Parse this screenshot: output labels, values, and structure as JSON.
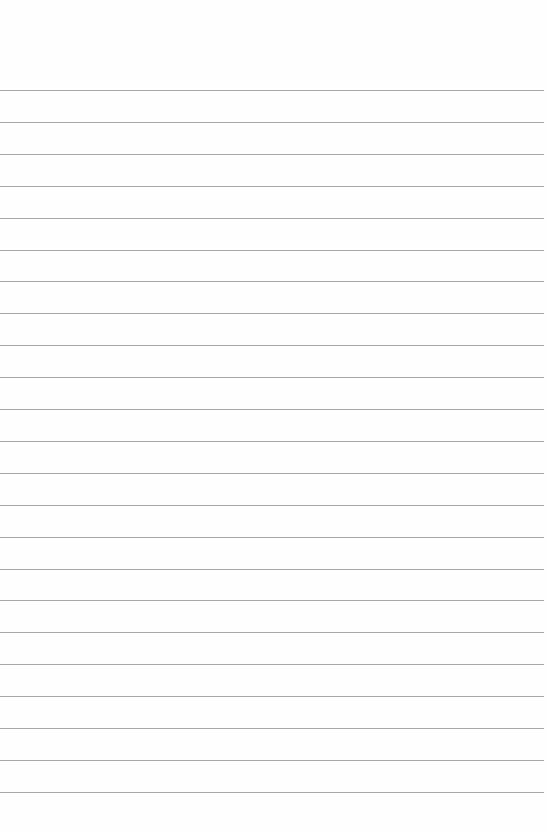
{
  "paper": {
    "background": "#fefefe",
    "line_color": "#9a9a9a",
    "first_line_y": 90,
    "line_spacing": 31.9,
    "line_count": 23,
    "line_left": 0,
    "line_right": 544
  }
}
